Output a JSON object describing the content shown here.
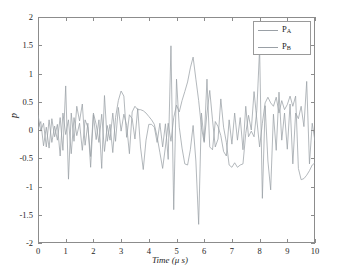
{
  "chart_data": {
    "type": "line",
    "title": "",
    "xlabel": "Time (μ s)",
    "ylabel": "p",
    "xlim": [
      0,
      10
    ],
    "ylim": [
      -2,
      2
    ],
    "xticks": [
      0,
      1,
      2,
      3,
      4,
      5,
      6,
      7,
      8,
      9,
      10
    ],
    "xtick_labels": [
      "0",
      "1",
      "2",
      "3",
      "4",
      "5",
      "6",
      "7",
      "8",
      "9",
      "10"
    ],
    "yticks": [
      -2,
      -1.5,
      -1,
      -0.5,
      0,
      0.5,
      1,
      1.5,
      2
    ],
    "ytick_labels": [
      "-2",
      "-1.5",
      "-1",
      "-0.5",
      "0",
      "0.5",
      "1",
      "1.5",
      "2"
    ],
    "grid": false,
    "legend_position": "upper right",
    "legend_entries": [
      "P_A",
      "P_B"
    ],
    "series": [
      {
        "name": "P_A",
        "label_main": "P",
        "label_sub": "A",
        "color": "#9aa0a6",
        "x": [
          0,
          0.1,
          0.2,
          0.3,
          0.4,
          0.5,
          0.6,
          0.7,
          0.8,
          0.9,
          1.0,
          1.1,
          1.2,
          1.3,
          1.4,
          1.5,
          1.6,
          1.7,
          1.8,
          1.9,
          2.0,
          2.1,
          2.2,
          2.3,
          2.4,
          2.5,
          2.6,
          2.7,
          2.8,
          2.9,
          3.0,
          3.1,
          3.2,
          3.3,
          3.4,
          3.5,
          3.6,
          3.7,
          3.8,
          3.9,
          4.0,
          4.1,
          4.2,
          4.3,
          4.4,
          4.5,
          4.6,
          4.7,
          4.8,
          4.9,
          5.0,
          5.1,
          5.2,
          5.3,
          5.4,
          5.5,
          5.6,
          5.7,
          5.8,
          5.9,
          6.0,
          6.1,
          6.2,
          6.3,
          6.4,
          6.5,
          6.6,
          6.7,
          6.8,
          6.9,
          7.0,
          7.1,
          7.2,
          7.3,
          7.4,
          7.5,
          7.6,
          7.7,
          7.8,
          7.9,
          8.0,
          8.1,
          8.2,
          8.3,
          8.4,
          8.5,
          8.6,
          8.7,
          8.8,
          8.9,
          9.0,
          9.1,
          9.2,
          9.3,
          9.4,
          9.5,
          9.6,
          9.7,
          9.8,
          9.9,
          10.0
        ],
        "y": [
          0.27,
          -0.02,
          0.12,
          -0.3,
          0.18,
          -0.22,
          0.07,
          -0.18,
          0.22,
          -0.36,
          0.78,
          -0.87,
          0.3,
          -0.2,
          0.42,
          0.16,
          0.46,
          -0.27,
          0.12,
          -0.66,
          0.27,
          -0.17,
          0.18,
          -0.68,
          0.61,
          -0.2,
          0.1,
          -0.4,
          0.22,
          0.52,
          0.69,
          0.6,
          -0.13,
          0.27,
          0.2,
          -0.16,
          0.38,
          -0.3,
          -0.7,
          -0.18,
          0.1,
          0.1,
          0.05,
          -0.22,
          0.12,
          -0.3,
          0.11,
          -0.52,
          1.49,
          -1.41,
          0.9,
          0.05,
          -0.32,
          -0.6,
          -0.62,
          -0.35,
          0.08,
          -0.55,
          -1.67,
          0.3,
          -0.2,
          0.9,
          -0.3,
          -0.35,
          0.15,
          0.06,
          -0.1,
          -0.38,
          -0.46,
          0.18,
          -0.25,
          0.3,
          -0.18,
          0.22,
          -0.35,
          0.42,
          -0.12,
          -0.02,
          -0.12,
          0.35,
          1.44,
          -1.21,
          0.43,
          -0.55,
          -1.06,
          0.28,
          -0.36,
          0.67,
          -0.18,
          0.3,
          -0.34,
          0.46,
          -0.6,
          0.3,
          0.2,
          0.42,
          0.06,
          0.86,
          -0.6,
          0.12,
          -0.2
        ]
      },
      {
        "name": "P_B",
        "label_main": "P",
        "label_sub": "B",
        "color": "#9aa0a6",
        "x": [
          0,
          0.1,
          0.2,
          0.3,
          0.4,
          0.5,
          0.6,
          0.7,
          0.8,
          0.9,
          1.0,
          1.1,
          1.2,
          1.3,
          1.4,
          1.5,
          1.6,
          1.7,
          1.8,
          1.9,
          2.0,
          2.1,
          2.2,
          2.3,
          2.4,
          2.5,
          2.6,
          2.7,
          2.8,
          2.9,
          3.0,
          3.1,
          3.2,
          3.3,
          3.4,
          3.5,
          3.6,
          3.7,
          3.8,
          3.9,
          4.0,
          4.1,
          4.2,
          4.3,
          4.4,
          4.5,
          4.6,
          4.7,
          4.8,
          4.9,
          5.0,
          5.1,
          5.2,
          5.3,
          5.4,
          5.5,
          5.6,
          5.7,
          5.8,
          5.9,
          6.0,
          6.1,
          6.2,
          6.3,
          6.4,
          6.5,
          6.6,
          6.7,
          6.8,
          6.9,
          7.0,
          7.1,
          7.2,
          7.3,
          7.4,
          7.5,
          7.6,
          7.7,
          7.8,
          7.9,
          8.0,
          8.1,
          8.2,
          8.3,
          8.4,
          8.5,
          8.6,
          8.7,
          8.8,
          8.9,
          9.0,
          9.1,
          9.2,
          9.3,
          9.4,
          9.5,
          9.6,
          9.7,
          9.8,
          9.9,
          10.0
        ],
        "y": [
          0.02,
          0.15,
          -0.28,
          0.05,
          -0.32,
          0.2,
          -0.12,
          0.1,
          -0.46,
          0.3,
          -0.08,
          0.18,
          -0.42,
          0.22,
          -0.1,
          0.12,
          -0.36,
          0.18,
          0.05,
          -0.47,
          0.3,
          0.1,
          -0.22,
          0.28,
          -0.38,
          0.08,
          -0.18,
          0.3,
          -0.2,
          0.4,
          -0.02,
          0.28,
          0.08,
          -0.42,
          0.32,
          0.42,
          0.36,
          0.36,
          0.34,
          0.3,
          0.24,
          0.18,
          0.1,
          -0.12,
          -0.4,
          -0.68,
          -0.3,
          0.12,
          -0.2,
          0.22,
          0.44,
          0.32,
          0.52,
          0.68,
          0.85,
          1.1,
          1.29,
          0.9,
          0.52,
          0.05,
          -0.22,
          0.3,
          0.7,
          0.18,
          -0.3,
          -0.16,
          0.55,
          0.05,
          -0.22,
          -0.62,
          -0.66,
          -0.58,
          -0.66,
          -0.62,
          -0.6,
          -0.06,
          0.26,
          0.0,
          0.68,
          0.18,
          -0.3,
          0.12,
          0.48,
          0.58,
          0.48,
          0.42,
          0.58,
          0.3,
          0.52,
          0.36,
          0.45,
          0.6,
          0.42,
          0.6,
          -0.68,
          -0.88,
          -0.86,
          -0.8,
          -0.72,
          -0.62,
          -0.58
        ]
      }
    ]
  },
  "axes": {
    "x_axis_label": "Time (μ s)",
    "y_axis_label": "p"
  }
}
